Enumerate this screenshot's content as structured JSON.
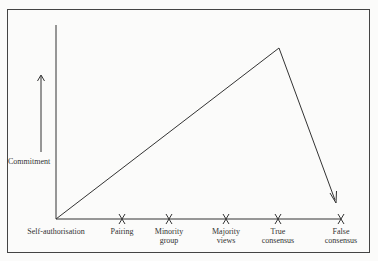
{
  "diagram": {
    "y_axis_label": "Commitment",
    "x_stages": [
      {
        "id": "self-authorisation",
        "lines": [
          "Self-authorisation"
        ],
        "x": 56,
        "marker": false
      },
      {
        "id": "pairing",
        "lines": [
          "Pairing"
        ],
        "x": 122,
        "marker": true
      },
      {
        "id": "minority-group",
        "lines": [
          "Minority",
          "group"
        ],
        "x": 169,
        "marker": true
      },
      {
        "id": "majority-views",
        "lines": [
          "Majority",
          "views"
        ],
        "x": 226,
        "marker": true
      },
      {
        "id": "true-consensus",
        "lines": [
          "True",
          "consensus"
        ],
        "x": 278,
        "marker": true
      },
      {
        "id": "false-consensus",
        "lines": [
          "False",
          "consensus"
        ],
        "x": 341,
        "marker": true
      }
    ],
    "path": {
      "start": [
        56,
        219
      ],
      "peak": [
        279,
        48
      ],
      "end": [
        335,
        200
      ]
    },
    "colors": {
      "line": "#333333",
      "frame": "#444444",
      "background": "#fbfbfa"
    }
  }
}
